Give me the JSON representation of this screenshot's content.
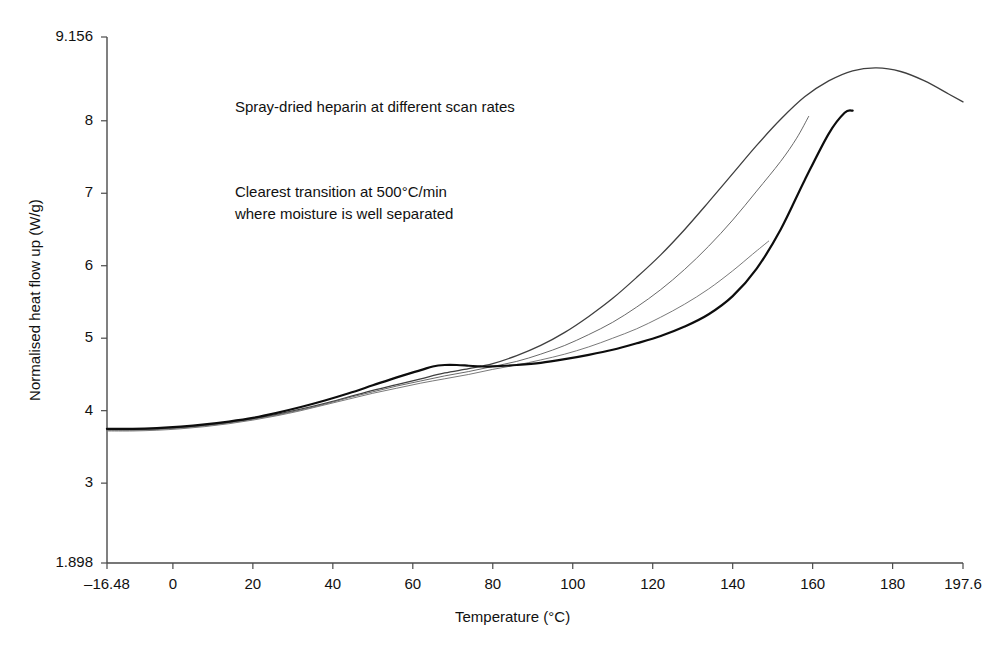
{
  "chart_data": {
    "type": "line",
    "title": "",
    "xlabel": "Temperature (°C)",
    "ylabel": "Normalised heat flow up (W/g)",
    "xlim": [
      -16.48,
      197.6
    ],
    "ylim": [
      1.898,
      9.156
    ],
    "grid": false,
    "legend": "none",
    "xticks": [
      -16.48,
      0,
      20,
      40,
      60,
      80,
      100,
      120,
      140,
      160,
      180,
      197.6
    ],
    "xticklabels": [
      "–16.48",
      "0",
      "20",
      "40",
      "60",
      "80",
      "100",
      "120",
      "140",
      "160",
      "180",
      "197.6"
    ],
    "yticks": [
      1.898,
      3,
      4,
      5,
      6,
      7,
      8,
      9.156
    ],
    "yticklabels": [
      "1.898",
      "3",
      "4",
      "5",
      "6",
      "7",
      "8",
      "9.156"
    ],
    "annotations": [
      {
        "name": "annotation-title",
        "text": "Spray-dried heparin at different scan rates",
        "x": 0,
        "y": 8.19
      },
      {
        "name": "annotation-note-line1",
        "text": "Clearest transition at 500°C/min",
        "x": 0,
        "y": 7.02
      },
      {
        "name": "annotation-note-line2",
        "text": "where moisture is well separated",
        "x": 0,
        "y": 6.72
      }
    ],
    "series": [
      {
        "name": "scan-rate-curve-1",
        "label": "500°C/min",
        "color": "#3f3f3f",
        "width": 1.3,
        "points": [
          [
            -16.5,
            3.74
          ],
          [
            -10,
            3.74
          ],
          [
            -4,
            3.75
          ],
          [
            2,
            3.77
          ],
          [
            8,
            3.8
          ],
          [
            14,
            3.84
          ],
          [
            20,
            3.89
          ],
          [
            26,
            3.95
          ],
          [
            32,
            4.02
          ],
          [
            38,
            4.1
          ],
          [
            44,
            4.19
          ],
          [
            50,
            4.28
          ],
          [
            56,
            4.36
          ],
          [
            62,
            4.44
          ],
          [
            68,
            4.52
          ],
          [
            74,
            4.58
          ],
          [
            80,
            4.65
          ],
          [
            86,
            4.76
          ],
          [
            92,
            4.9
          ],
          [
            98,
            5.08
          ],
          [
            104,
            5.3
          ],
          [
            110,
            5.55
          ],
          [
            116,
            5.84
          ],
          [
            122,
            6.15
          ],
          [
            128,
            6.5
          ],
          [
            134,
            6.88
          ],
          [
            140,
            7.27
          ],
          [
            146,
            7.66
          ],
          [
            152,
            8.02
          ],
          [
            158,
            8.33
          ],
          [
            164,
            8.55
          ],
          [
            170,
            8.69
          ],
          [
            176,
            8.73
          ],
          [
            182,
            8.68
          ],
          [
            188,
            8.55
          ],
          [
            194,
            8.37
          ],
          [
            197.6,
            8.26
          ]
        ]
      },
      {
        "name": "scan-rate-curve-2",
        "label": "intermediate-rate",
        "color": "#6a6a6a",
        "width": 1.0,
        "points": [
          [
            -16.5,
            3.73
          ],
          [
            -10,
            3.73
          ],
          [
            -4,
            3.74
          ],
          [
            2,
            3.76
          ],
          [
            8,
            3.79
          ],
          [
            14,
            3.83
          ],
          [
            20,
            3.88
          ],
          [
            26,
            3.94
          ],
          [
            32,
            4.01
          ],
          [
            38,
            4.09
          ],
          [
            44,
            4.18
          ],
          [
            50,
            4.26
          ],
          [
            56,
            4.34
          ],
          [
            62,
            4.41
          ],
          [
            68,
            4.48
          ],
          [
            74,
            4.54
          ],
          [
            80,
            4.61
          ],
          [
            86,
            4.68
          ],
          [
            92,
            4.78
          ],
          [
            98,
            4.9
          ],
          [
            104,
            5.05
          ],
          [
            110,
            5.22
          ],
          [
            116,
            5.43
          ],
          [
            122,
            5.67
          ],
          [
            128,
            5.95
          ],
          [
            134,
            6.27
          ],
          [
            140,
            6.63
          ],
          [
            146,
            7.03
          ],
          [
            152,
            7.44
          ],
          [
            156,
            7.76
          ],
          [
            159,
            8.06
          ]
        ]
      },
      {
        "name": "scan-rate-curve-3",
        "label": "slower-rate",
        "color": "#7a7a7a",
        "width": 1.0,
        "points": [
          [
            -16.5,
            3.72
          ],
          [
            -10,
            3.72
          ],
          [
            -4,
            3.73
          ],
          [
            2,
            3.75
          ],
          [
            8,
            3.78
          ],
          [
            14,
            3.82
          ],
          [
            20,
            3.87
          ],
          [
            26,
            3.93
          ],
          [
            32,
            4.0
          ],
          [
            38,
            4.08
          ],
          [
            44,
            4.16
          ],
          [
            50,
            4.24
          ],
          [
            56,
            4.31
          ],
          [
            62,
            4.38
          ],
          [
            68,
            4.44
          ],
          [
            74,
            4.5
          ],
          [
            80,
            4.57
          ],
          [
            86,
            4.63
          ],
          [
            92,
            4.7
          ],
          [
            98,
            4.78
          ],
          [
            104,
            4.88
          ],
          [
            110,
            5.0
          ],
          [
            116,
            5.13
          ],
          [
            122,
            5.29
          ],
          [
            128,
            5.47
          ],
          [
            134,
            5.68
          ],
          [
            140,
            5.93
          ],
          [
            145,
            6.16
          ],
          [
            149,
            6.34
          ]
        ]
      },
      {
        "name": "scan-rate-curve-4",
        "label": "slowest-rate",
        "color": "#0d0d0d",
        "width": 2.2,
        "points": [
          [
            -16.5,
            3.75
          ],
          [
            -10,
            3.75
          ],
          [
            -4,
            3.76
          ],
          [
            2,
            3.78
          ],
          [
            8,
            3.81
          ],
          [
            14,
            3.85
          ],
          [
            20,
            3.9
          ],
          [
            26,
            3.97
          ],
          [
            32,
            4.05
          ],
          [
            38,
            4.14
          ],
          [
            44,
            4.24
          ],
          [
            50,
            4.35
          ],
          [
            56,
            4.46
          ],
          [
            62,
            4.56
          ],
          [
            65,
            4.61
          ],
          [
            68,
            4.63
          ],
          [
            71,
            4.63
          ],
          [
            74,
            4.62
          ],
          [
            77,
            4.61
          ],
          [
            80,
            4.61
          ],
          [
            86,
            4.63
          ],
          [
            92,
            4.66
          ],
          [
            98,
            4.71
          ],
          [
            104,
            4.77
          ],
          [
            110,
            4.84
          ],
          [
            116,
            4.93
          ],
          [
            122,
            5.03
          ],
          [
            128,
            5.16
          ],
          [
            134,
            5.33
          ],
          [
            140,
            5.58
          ],
          [
            146,
            5.96
          ],
          [
            152,
            6.5
          ],
          [
            158,
            7.18
          ],
          [
            164,
            7.82
          ],
          [
            168,
            8.11
          ],
          [
            170,
            8.14
          ]
        ]
      }
    ]
  }
}
